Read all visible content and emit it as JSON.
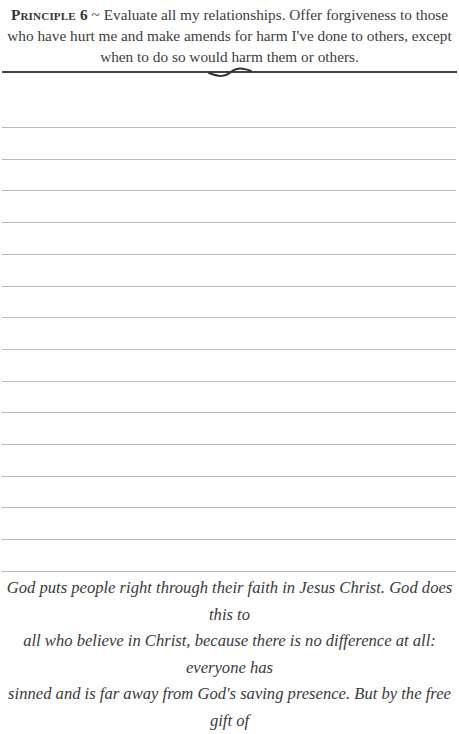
{
  "header": {
    "label": "Principle 6",
    "separator": " ~ ",
    "text": "Evaluate all my relationships. Offer forgiveness to those who have hurt me and make amends for harm I've done to others, except when to do so would harm them or others."
  },
  "writing_lines": {
    "count": 15,
    "first_y": 127,
    "spacing": 31.7,
    "color": "#bdbdbd"
  },
  "quote": {
    "lines": [
      "God puts people right through their faith in Jesus Christ. God does this to",
      "all who believe in Christ, because there is no difference at all: everyone has",
      "sinned and is far away from God's saving presence. But by the free gift of"
    ]
  }
}
